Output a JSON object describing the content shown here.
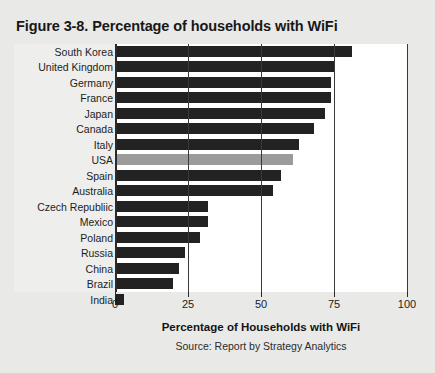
{
  "figure": {
    "title": "Figure 3-8. Percentage of households with WiFi",
    "source": "Source: Report by Strategy Analytics"
  },
  "chart_data": {
    "type": "bar",
    "orientation": "horizontal",
    "title": "Figure 3-8. Percentage of households with WiFi",
    "xlabel": "Percentage of Households with WiFi",
    "ylabel": "",
    "xlim": [
      0,
      100
    ],
    "xticks": [
      0,
      25,
      50,
      75,
      100
    ],
    "xtick_labels": [
      "0",
      "25",
      "50",
      "75",
      "100"
    ],
    "grid": true,
    "legend": false,
    "bar_color": "#222222",
    "highlight_color": "#9b9b9b",
    "highlight_category": "USA",
    "source": "Source: Report by Strategy Analytics",
    "categories": [
      "South Korea",
      "United Kingdom",
      "Germany",
      "France",
      "Japan",
      "Canada",
      "Italy",
      "USA",
      "Spain",
      "Australia",
      "Czech Republiic",
      "Mexico",
      "Poland",
      "Russia",
      "China",
      "Brazil",
      "India"
    ],
    "values": [
      81,
      75,
      74,
      74,
      72,
      68,
      63,
      61,
      57,
      54,
      32,
      32,
      29,
      24,
      22,
      20,
      3
    ]
  }
}
